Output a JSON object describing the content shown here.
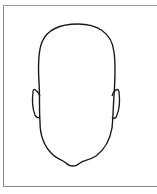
{
  "figure": {
    "stroke_color": "#1a1a1a",
    "frame_color": "#8a8a8a",
    "background": "#ffffff"
  }
}
